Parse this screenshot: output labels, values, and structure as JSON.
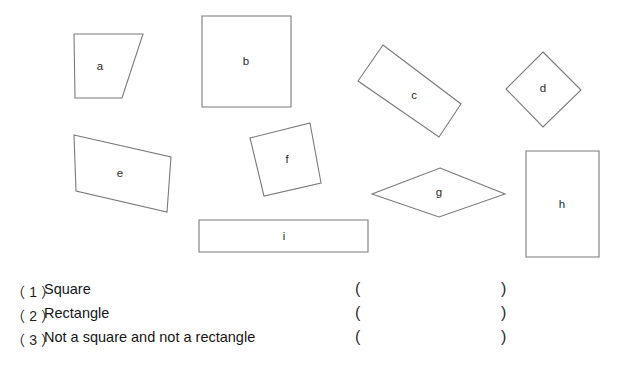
{
  "page": {
    "background_color": "#ffffff",
    "shape_stroke_color": "#7a7a7a",
    "text_color": "#161616"
  },
  "figure": {
    "name": "quadrilaterals-figure",
    "shapes": [
      {
        "id": "a",
        "label": "a",
        "kind": "trapezoid",
        "points": "74,34 143,34 122,98 75,98",
        "label_x": 100,
        "label_y": 67
      },
      {
        "id": "b",
        "label": "b",
        "kind": "square",
        "points": "202,16 291,16 291,107 202,107",
        "label_x": 246,
        "label_y": 62
      },
      {
        "id": "c",
        "label": "c",
        "kind": "rectangle-rotated",
        "points": "383,45 461,104 439,137 358,81",
        "label_x": 414,
        "label_y": 96
      },
      {
        "id": "d",
        "label": "d",
        "kind": "square-rotated",
        "points": "543,52 581,90 543,127 506,89",
        "label_x": 543,
        "label_y": 89
      },
      {
        "id": "e",
        "label": "e",
        "kind": "trapezoid",
        "points": "74,135 171,157 167,212 76,191",
        "label_x": 120,
        "label_y": 174
      },
      {
        "id": "f",
        "label": "f",
        "kind": "square-rotated",
        "points": "310,123 321,183 264,196 250,138",
        "label_x": 287,
        "label_y": 160
      },
      {
        "id": "g",
        "label": "g",
        "kind": "rhombus",
        "points": "440,168 505,194 439,217 372,194",
        "label_x": 439,
        "label_y": 193
      },
      {
        "id": "h",
        "label": "h",
        "kind": "rectangle",
        "points": "526,151 599,151 599,257 526,257",
        "label_x": 562,
        "label_y": 205
      },
      {
        "id": "i",
        "label": "i",
        "kind": "rectangle",
        "points": "199,220 368,220 368,252 199,252",
        "label_x": 284,
        "label_y": 237
      }
    ]
  },
  "questions": {
    "paren_open": "(",
    "paren_close": ")",
    "items": [
      {
        "index": "（ 1 ）",
        "label": "Square",
        "answer": ""
      },
      {
        "index": "（ 2 ）",
        "label": "Rectangle",
        "answer": ""
      },
      {
        "index": "（ 3 ）",
        "label": "Not a square and not a rectangle",
        "answer": ""
      }
    ]
  }
}
